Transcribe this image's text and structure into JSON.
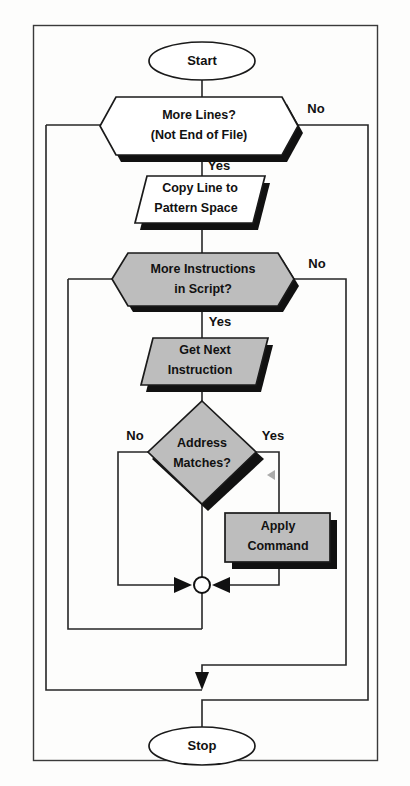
{
  "diagram": {
    "colors": {
      "shape_fill_white": "#ffffff",
      "shape_fill_gray": "#bdbdbd",
      "stroke": "#1a1a1a",
      "shadow": "#111111",
      "frame": "#3a3a3a",
      "background": "#fdfdfc"
    },
    "nodes": [
      {
        "id": "start",
        "shape": "ellipse",
        "label": "Start",
        "fill": "white"
      },
      {
        "id": "more_lines",
        "shape": "hexagon",
        "label_line1": "More Lines?",
        "label_line2": "(Not End of File)",
        "fill": "white"
      },
      {
        "id": "copy_line",
        "shape": "parallelogram",
        "label_line1": "Copy Line to",
        "label_line2": "Pattern Space",
        "fill": "white"
      },
      {
        "id": "more_instructions",
        "shape": "hexagon",
        "label_line1": "More Instructions",
        "label_line2": "in Script?",
        "fill": "gray"
      },
      {
        "id": "get_next",
        "shape": "parallelogram",
        "label_line1": "Get Next",
        "label_line2": "Instruction",
        "fill": "gray"
      },
      {
        "id": "address_matches",
        "shape": "diamond",
        "label_line1": "Address",
        "label_line2": "Matches?",
        "fill": "gray"
      },
      {
        "id": "apply_command",
        "shape": "rectangle",
        "label_line1": "Apply",
        "label_line2": "Command",
        "fill": "gray"
      },
      {
        "id": "merge",
        "shape": "circle",
        "label": "",
        "fill": "white"
      },
      {
        "id": "stop",
        "shape": "ellipse",
        "label": "Stop",
        "fill": "white"
      }
    ],
    "edge_labels": {
      "more_lines_no": "No",
      "more_lines_yes": "Yes",
      "more_instructions_no": "No",
      "more_instructions_yes": "Yes",
      "address_no": "No",
      "address_yes": "Yes"
    }
  }
}
